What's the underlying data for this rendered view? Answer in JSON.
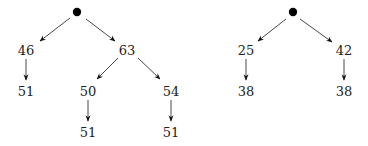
{
  "diagram": {
    "type": "trees",
    "trees": [
      {
        "name": "left-tree",
        "root": {
          "x": 77,
          "y": 12
        },
        "nodes": [
          {
            "id": "l1",
            "label": "46",
            "x": 26,
            "y": 50
          },
          {
            "id": "l2",
            "label": "63",
            "x": 127,
            "y": 50
          },
          {
            "id": "l3",
            "label": "51",
            "x": 26,
            "y": 91
          },
          {
            "id": "l4",
            "label": "50",
            "x": 88,
            "y": 91
          },
          {
            "id": "l5",
            "label": "54",
            "x": 171,
            "y": 91
          },
          {
            "id": "l6",
            "label": "51",
            "x": 88,
            "y": 132
          },
          {
            "id": "l7",
            "label": "51",
            "x": 171,
            "y": 132
          }
        ]
      },
      {
        "name": "right-tree",
        "root": {
          "x": 293,
          "y": 12
        },
        "nodes": [
          {
            "id": "r1",
            "label": "25",
            "x": 246,
            "y": 50
          },
          {
            "id": "r2",
            "label": "42",
            "x": 344,
            "y": 50
          },
          {
            "id": "r3",
            "label": "38",
            "x": 246,
            "y": 91
          },
          {
            "id": "r4",
            "label": "38",
            "x": 344,
            "y": 91
          }
        ]
      }
    ]
  }
}
